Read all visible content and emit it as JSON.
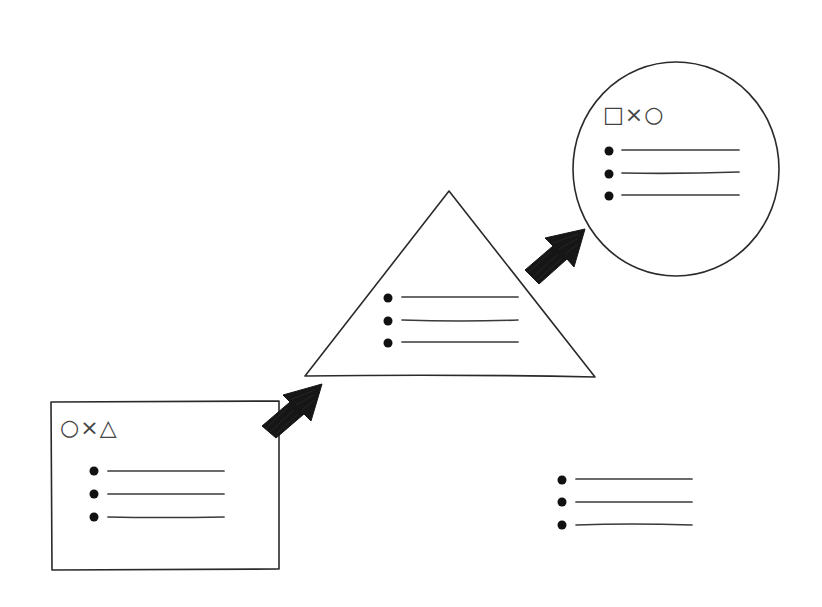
{
  "diagram": {
    "type": "flow",
    "style": "hand-drawn sketch",
    "colors": {
      "stroke": "#2a2a2a",
      "arrow": "#161616",
      "background": "#ffffff"
    },
    "nodes": [
      {
        "id": "rectangle",
        "shape": "rectangle",
        "label": "○×△",
        "bullet_count": 3
      },
      {
        "id": "triangle",
        "shape": "triangle",
        "label": "",
        "bullet_count": 3
      },
      {
        "id": "circle",
        "shape": "circle",
        "label": "□×○",
        "bullet_count": 3
      },
      {
        "id": "free-list",
        "shape": "none",
        "label": "",
        "bullet_count": 3
      }
    ],
    "edges": [
      {
        "from": "rectangle",
        "to": "triangle",
        "style": "bold-arrow"
      },
      {
        "from": "triangle",
        "to": "circle",
        "style": "bold-arrow"
      }
    ]
  }
}
